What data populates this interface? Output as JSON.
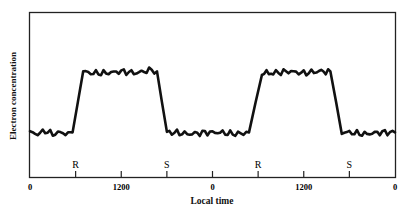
{
  "chart_data": {
    "type": "line",
    "title": "",
    "xlabel": "Local time",
    "ylabel": "Electron concentration",
    "x_units": "hours (two days, 0-48)",
    "xlim": [
      0,
      48
    ],
    "ylim": [
      0,
      1
    ],
    "grid": false,
    "legend": null,
    "x_tick_labels": [
      {
        "hour": 0,
        "label": "0"
      },
      {
        "hour": 12,
        "label": "1200"
      },
      {
        "hour": 24,
        "label": "0"
      },
      {
        "hour": 36,
        "label": "1200"
      },
      {
        "hour": 48,
        "label": "0"
      }
    ],
    "x_minor_ticks": [
      6,
      18,
      30,
      42
    ],
    "annotations": [
      {
        "hour": 6,
        "label": "R",
        "meaning": "sunrise"
      },
      {
        "hour": 18,
        "label": "S",
        "meaning": "sunset"
      },
      {
        "hour": 30,
        "label": "R",
        "meaning": "sunrise"
      },
      {
        "hour": 42,
        "label": "S",
        "meaning": "sunset"
      }
    ],
    "y_tick_labels": [],
    "series": [
      {
        "name": "Electron concentration",
        "x": [
          0,
          1,
          2,
          3,
          4,
          5,
          5.6,
          7,
          8,
          10,
          12,
          14,
          16,
          16.7,
          18,
          19,
          21,
          23,
          25,
          27,
          28.8,
          30.5,
          32,
          34,
          36,
          38,
          39.5,
          41,
          42,
          44,
          46,
          48
        ],
        "y": [
          0.27,
          0.26,
          0.28,
          0.26,
          0.27,
          0.26,
          0.27,
          0.64,
          0.63,
          0.63,
          0.64,
          0.63,
          0.65,
          0.64,
          0.27,
          0.27,
          0.26,
          0.27,
          0.27,
          0.26,
          0.27,
          0.63,
          0.63,
          0.64,
          0.63,
          0.64,
          0.64,
          0.27,
          0.27,
          0.26,
          0.27,
          0.27
        ]
      }
    ]
  }
}
